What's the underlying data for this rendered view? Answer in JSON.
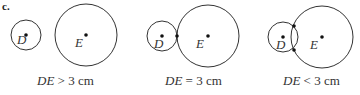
{
  "part_label": "c.",
  "stroke_color": "#333333",
  "panels": [
    {
      "caption": {
        "lhs": "DE",
        "op": ">",
        "rhs": "3 cm"
      },
      "circles": [
        {
          "label": "D",
          "cx": 26,
          "cy": 35,
          "r": 15
        },
        {
          "label": "E",
          "cx": 86,
          "cy": 35,
          "r": 31
        }
      ],
      "intersection_points": []
    },
    {
      "caption": {
        "lhs": "DE",
        "op": "=",
        "rhs": "3 cm"
      },
      "circles": [
        {
          "label": "D",
          "cx": 162,
          "cy": 36,
          "r": 15
        },
        {
          "label": "E",
          "cx": 207,
          "cy": 36,
          "r": 31
        }
      ],
      "intersection_points": [
        {
          "x": 177,
          "y": 36
        }
      ]
    },
    {
      "caption": {
        "lhs": "DE",
        "op": "<",
        "rhs": "3 cm"
      },
      "circles": [
        {
          "label": "D",
          "cx": 283,
          "cy": 37,
          "r": 15
        },
        {
          "label": "E",
          "cx": 322,
          "cy": 37,
          "r": 31
        }
      ],
      "intersection_points": [
        {
          "x": 294,
          "y": 25
        },
        {
          "x": 294,
          "y": 50
        }
      ]
    }
  ]
}
